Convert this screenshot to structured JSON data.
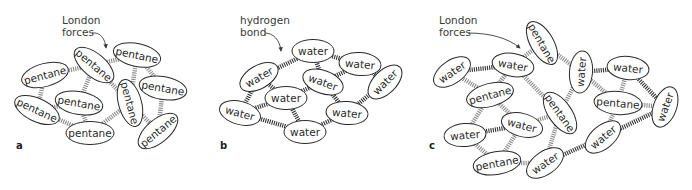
{
  "colors": {
    "london_bond": "#8a8a8a",
    "hydrogen_bond": "#333333",
    "outline": "#2a2a2a"
  },
  "panels": [
    {
      "id": "a",
      "label": "a",
      "annotation": {
        "line1": "London",
        "line2": "forces"
      },
      "bond_type": "london",
      "molecules": [
        {
          "name": "pentane",
          "x": 45,
          "y": 75,
          "rot": -15
        },
        {
          "name": "pentane",
          "x": 94,
          "y": 65,
          "rot": 40
        },
        {
          "name": "pentane",
          "x": 137,
          "y": 55,
          "rot": 12
        },
        {
          "name": "pentane",
          "x": 163,
          "y": 88,
          "rot": 10
        },
        {
          "name": "pentane",
          "x": 37,
          "y": 110,
          "rot": 25
        },
        {
          "name": "pentane",
          "x": 79,
          "y": 103,
          "rot": 10
        },
        {
          "name": "pentane",
          "x": 130,
          "y": 103,
          "rot": 75
        },
        {
          "name": "pentane",
          "x": 90,
          "y": 133,
          "rot": 0
        },
        {
          "name": "pentane",
          "x": 158,
          "y": 131,
          "rot": -40
        }
      ],
      "bonds": [
        [
          0,
          1
        ],
        [
          0,
          4
        ],
        [
          1,
          2
        ],
        [
          1,
          5
        ],
        [
          1,
          6
        ],
        [
          2,
          3
        ],
        [
          2,
          6
        ],
        [
          3,
          8
        ],
        [
          4,
          5
        ],
        [
          4,
          7
        ],
        [
          5,
          7
        ],
        [
          6,
          7
        ],
        [
          6,
          8
        ]
      ]
    },
    {
      "id": "b",
      "label": "b",
      "annotation": {
        "line1": "hydrogen",
        "line2": "bond"
      },
      "bond_type": "hydrogen",
      "molecules": [
        {
          "name": "water",
          "x": 313,
          "y": 51,
          "rot": 0
        },
        {
          "name": "water",
          "x": 360,
          "y": 64,
          "rot": 5
        },
        {
          "name": "water",
          "x": 259,
          "y": 77,
          "rot": -30
        },
        {
          "name": "water",
          "x": 323,
          "y": 82,
          "rot": 20
        },
        {
          "name": "water",
          "x": 385,
          "y": 82,
          "rot": -45
        },
        {
          "name": "water",
          "x": 286,
          "y": 98,
          "rot": 0
        },
        {
          "name": "water",
          "x": 240,
          "y": 113,
          "rot": 15
        },
        {
          "name": "water",
          "x": 347,
          "y": 113,
          "rot": 5
        },
        {
          "name": "water",
          "x": 305,
          "y": 132,
          "rot": 0
        }
      ],
      "bonds": [
        [
          0,
          2
        ],
        [
          0,
          1
        ],
        [
          0,
          3
        ],
        [
          1,
          3
        ],
        [
          1,
          4
        ],
        [
          2,
          5
        ],
        [
          2,
          6
        ],
        [
          3,
          5
        ],
        [
          3,
          7
        ],
        [
          4,
          7
        ],
        [
          5,
          6
        ],
        [
          5,
          8
        ],
        [
          6,
          8
        ],
        [
          7,
          8
        ]
      ]
    },
    {
      "id": "c",
      "label": "c",
      "annotation": {
        "line1": "London",
        "line2": "forces"
      },
      "bond_type": "mixed",
      "molecules": [
        {
          "name": "pentane",
          "x": 542,
          "y": 43,
          "rot": 60
        },
        {
          "name": "water",
          "x": 452,
          "y": 72,
          "rot": -35
        },
        {
          "name": "water",
          "x": 513,
          "y": 65,
          "rot": 10
        },
        {
          "name": "water",
          "x": 581,
          "y": 72,
          "rot": -85
        },
        {
          "name": "water",
          "x": 628,
          "y": 68,
          "rot": 6
        },
        {
          "name": "pentane",
          "x": 490,
          "y": 95,
          "rot": -15
        },
        {
          "name": "pentane",
          "x": 560,
          "y": 113,
          "rot": 55
        },
        {
          "name": "pentane",
          "x": 618,
          "y": 103,
          "rot": 5
        },
        {
          "name": "water",
          "x": 665,
          "y": 107,
          "rot": -70
        },
        {
          "name": "water",
          "x": 522,
          "y": 125,
          "rot": 15
        },
        {
          "name": "water",
          "x": 465,
          "y": 135,
          "rot": -5
        },
        {
          "name": "water",
          "x": 603,
          "y": 137,
          "rot": -40
        },
        {
          "name": "pentane",
          "x": 497,
          "y": 163,
          "rot": -10
        },
        {
          "name": "water",
          "x": 545,
          "y": 163,
          "rot": -35
        }
      ],
      "bonds": [
        [
          0,
          2,
          "london"
        ],
        [
          0,
          3,
          "london"
        ],
        [
          1,
          2,
          "hydrogen"
        ],
        [
          1,
          5,
          "london"
        ],
        [
          2,
          5,
          "london"
        ],
        [
          2,
          6,
          "london"
        ],
        [
          3,
          4,
          "hydrogen"
        ],
        [
          3,
          6,
          "london"
        ],
        [
          3,
          7,
          "london"
        ],
        [
          4,
          7,
          "london"
        ],
        [
          4,
          8,
          "hydrogen"
        ],
        [
          5,
          9,
          "london"
        ],
        [
          5,
          10,
          "london"
        ],
        [
          6,
          9,
          "london"
        ],
        [
          6,
          13,
          "london"
        ],
        [
          7,
          8,
          "london"
        ],
        [
          7,
          11,
          "london"
        ],
        [
          8,
          11,
          "hydrogen"
        ],
        [
          9,
          10,
          "hydrogen"
        ],
        [
          9,
          12,
          "london"
        ],
        [
          10,
          12,
          "london"
        ],
        [
          12,
          13,
          "london"
        ],
        [
          13,
          11,
          "hydrogen"
        ]
      ]
    }
  ]
}
